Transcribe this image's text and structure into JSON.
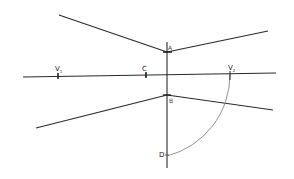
{
  "diagram": {
    "type": "two-point perspective construction (hand-drawn)",
    "colors": {
      "ink": "#2a2a2a",
      "arc": "#888888",
      "background": "#ffffff"
    },
    "labels": {
      "v1": "V",
      "v1_sub": "1",
      "c": "C",
      "v2": "V",
      "v2_sub": "2",
      "a": "A",
      "b": "B",
      "d": "D"
    },
    "points": {
      "V1": [
        58,
        76
      ],
      "C": [
        146,
        75
      ],
      "V2": [
        230,
        74
      ],
      "A": [
        167,
        52
      ],
      "B": [
        167,
        95
      ],
      "D": [
        167,
        155
      ]
    },
    "lines": [
      {
        "name": "horizon-line",
        "from": [
          23,
          77
        ],
        "to": [
          276,
          73
        ]
      },
      {
        "name": "vertical-line",
        "from": [
          167,
          42
        ],
        "to": [
          167,
          168
        ]
      },
      {
        "name": "upper-left-line",
        "from": [
          59,
          15
        ],
        "to": [
          167,
          52
        ]
      },
      {
        "name": "upper-right-line",
        "from": [
          167,
          52
        ],
        "to": [
          268,
          31
        ]
      },
      {
        "name": "lower-left-line",
        "from": [
          36,
          128
        ],
        "to": [
          167,
          95
        ]
      },
      {
        "name": "lower-right-line",
        "from": [
          167,
          95
        ],
        "to": [
          273,
          110
        ]
      }
    ],
    "arc": {
      "center": [
        146,
        75
      ],
      "radius": 84,
      "from": "V2",
      "to": "D"
    }
  }
}
